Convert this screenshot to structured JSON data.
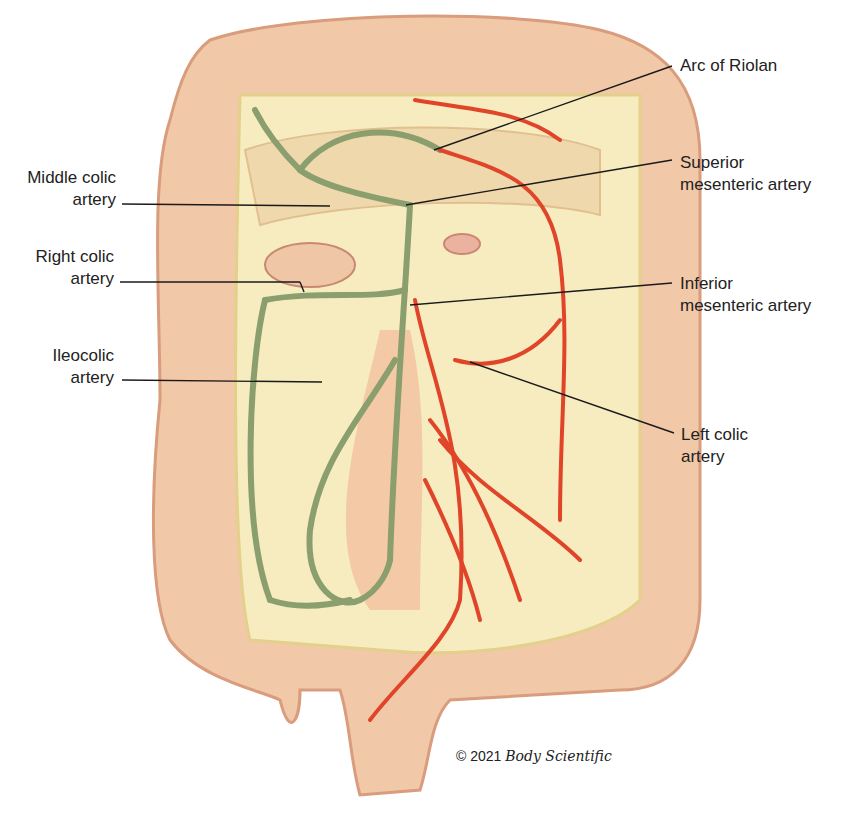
{
  "figure": {
    "colors": {
      "colon_outer": "#f1c9a8",
      "colon_shadow": "#d99c7c",
      "mesentery": "#f6ecc0",
      "mesentery_shadow": "#e3d08a",
      "sma_branches": "#8a9e6e",
      "ima_branches": "#e0452a",
      "leader_lines": "#1a1a1a",
      "text": "#222222"
    }
  },
  "labels": {
    "left": [
      {
        "id": "middle-colic",
        "line1": "Middle colic",
        "line2": "artery"
      },
      {
        "id": "right-colic",
        "line1": "Right colic",
        "line2": "artery"
      },
      {
        "id": "ileocolic",
        "line1": "Ileocolic",
        "line2": "artery"
      }
    ],
    "right": [
      {
        "id": "arc-of-riolan",
        "line1": "Arc of Riolan",
        "line2": ""
      },
      {
        "id": "superior-mesenteric",
        "line1": "Superior",
        "line2": "mesenteric artery"
      },
      {
        "id": "inferior-mesenteric",
        "line1": "Inferior",
        "line2": "mesenteric artery"
      },
      {
        "id": "left-colic",
        "line1": "Left colic",
        "line2": "artery"
      }
    ]
  },
  "copyright": {
    "prefix": "© 2021",
    "brand": "Body Scientific"
  }
}
